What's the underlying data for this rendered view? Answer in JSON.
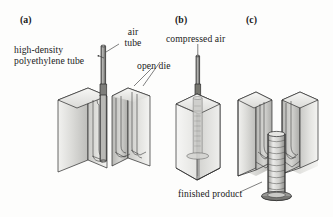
{
  "figure": {
    "background_color": "#fdfdfc",
    "ink_color": "#1a1a1a"
  },
  "panels": [
    {
      "id": "a",
      "label": "(a)",
      "x": 20,
      "y": 14,
      "caption": "open die with extruded polyethylene tube and air tube inserted"
    },
    {
      "id": "b",
      "label": "(b)",
      "x": 175,
      "y": 14,
      "caption": "closed die with compressed air inflating the tube"
    },
    {
      "id": "c",
      "label": "(c)",
      "x": 246,
      "y": 14,
      "caption": "die opened, finished product ejected"
    }
  ],
  "annotations": [
    {
      "name": "high-density-polyethylene-tube",
      "line1": "high-density",
      "line2": "polyethylene tube",
      "x": 14,
      "y": 44,
      "align": "left"
    },
    {
      "name": "air-tube",
      "line1": "air",
      "line2": "tube",
      "x": 120,
      "y": 26,
      "align": "left"
    },
    {
      "name": "open-die",
      "line1": "open die",
      "line2": "",
      "x": 137,
      "y": 60,
      "align": "left"
    },
    {
      "name": "compressed-air",
      "line1": "compressed air",
      "line2": "",
      "x": 166,
      "y": 33,
      "align": "left"
    },
    {
      "name": "finished-product",
      "line1": "finished product",
      "line2": "",
      "x": 178,
      "y": 188,
      "align": "left"
    }
  ],
  "colors": {
    "die_face_light": "#e8e8e6",
    "die_face_mid": "#d0d0cd",
    "die_face_dark": "#b4b4b1",
    "die_cavity": "#c4c4c1",
    "tube_metal": "#8e8e8c",
    "tube_metal_dark": "#5d5d5b",
    "product_fill": "#d8d8d5",
    "outline": "#2a2a2a",
    "leader_line": "#3a3a3a"
  },
  "elements": {
    "air_tube": "vertical thin metal tube entering die from top",
    "parison": "molten polyethylene tube hanging inside open die",
    "die_half_left": "left open die block with concave cavity",
    "die_half_right": "right open die block with concave cavity",
    "closed_die": "transparent closed die block",
    "finished_product": "ribbed cylindrical container with flanged base"
  }
}
